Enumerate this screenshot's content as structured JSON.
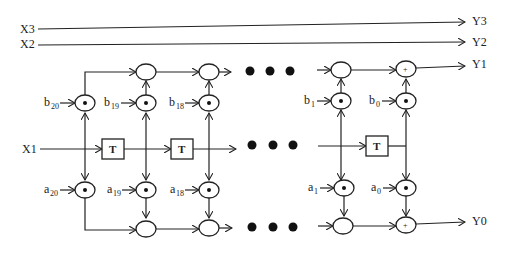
{
  "diagram": {
    "inputs": {
      "x3": "X3",
      "x2": "X2",
      "x1": "X1"
    },
    "outputs": {
      "y3": "Y3",
      "y2": "Y2",
      "y1": "Y1",
      "y0": "Y0"
    },
    "delay_label": "T",
    "plus_symbol": "+",
    "b_coeffs": [
      {
        "base": "b",
        "sub": "20"
      },
      {
        "base": "b",
        "sub": "19"
      },
      {
        "base": "b",
        "sub": "18"
      },
      {
        "base": "b",
        "sub": "1"
      },
      {
        "base": "b",
        "sub": "0"
      }
    ],
    "a_coeffs": [
      {
        "base": "a",
        "sub": "20"
      },
      {
        "base": "a",
        "sub": "19"
      },
      {
        "base": "a",
        "sub": "18"
      },
      {
        "base": "a",
        "sub": "1"
      },
      {
        "base": "a",
        "sub": "0"
      }
    ],
    "ellipsis": "• • •"
  }
}
